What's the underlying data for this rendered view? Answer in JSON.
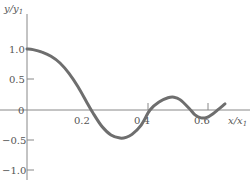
{
  "chart_data": {
    "type": "line",
    "title": "",
    "xlabel": "x/x1",
    "ylabel": "y/y1",
    "xlim": [
      0,
      0.68
    ],
    "ylim": [
      -1.1,
      1.4
    ],
    "grid": false,
    "legend": null,
    "x_ticks": [
      0.2,
      0.4,
      0.6
    ],
    "x_tick_labels": [
      "0.2",
      "0.4",
      "0.6"
    ],
    "y_ticks": [
      1.0,
      0.5,
      0,
      -0.5,
      -1.0
    ],
    "y_tick_labels": [
      "1.0",
      "0.5",
      "0",
      "−0.5",
      "−1.0"
    ],
    "series": [
      {
        "name": "y/y1",
        "color": "#6e6e6e",
        "x": [
          0.0,
          0.02,
          0.05,
          0.08,
          0.11,
          0.14,
          0.17,
          0.2,
          0.22,
          0.25,
          0.28,
          0.31,
          0.33,
          0.35,
          0.38,
          0.41,
          0.44,
          0.47,
          0.49,
          0.51,
          0.54,
          0.56,
          0.58,
          0.6,
          0.62,
          0.64,
          0.66
        ],
        "y": [
          1.0,
          0.99,
          0.95,
          0.88,
          0.77,
          0.6,
          0.38,
          0.12,
          -0.05,
          -0.27,
          -0.41,
          -0.46,
          -0.45,
          -0.4,
          -0.25,
          0.0,
          0.13,
          0.2,
          0.21,
          0.17,
          0.03,
          -0.08,
          -0.13,
          -0.12,
          -0.06,
          0.02,
          0.1
        ]
      }
    ]
  },
  "labels": {
    "y_axis_title": "y/y",
    "y_axis_sub": "1",
    "x_axis_title": "x/x",
    "x_axis_sub": "1",
    "x_ticks": [
      "0.2",
      "0.4",
      "0.6"
    ],
    "y_ticks": [
      "1.0",
      "0.5",
      "0",
      "−0.5",
      "−1.0"
    ]
  }
}
